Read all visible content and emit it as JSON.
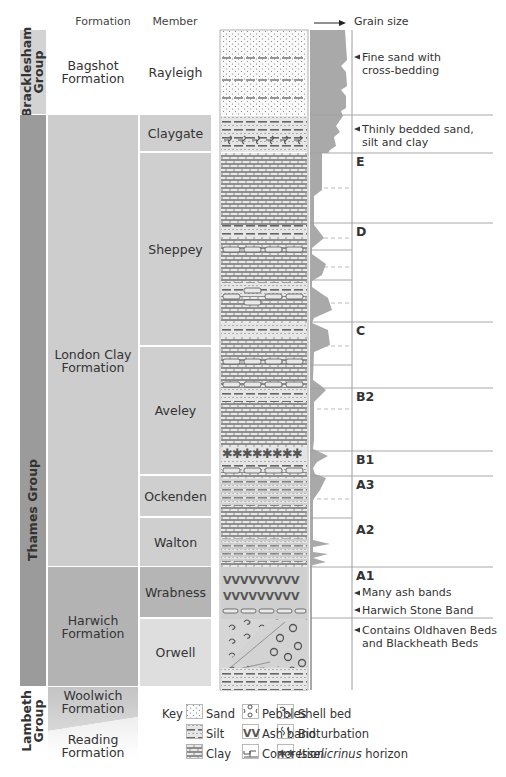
{
  "headers": {
    "formation": "Formation",
    "member": "Member",
    "grain_size": "Grain size"
  },
  "groups": [
    {
      "name": "Bracklesham Group",
      "line1": "Bracklesham",
      "line2": "Group",
      "color": "#d3d3d3"
    },
    {
      "name": "Thames Group",
      "line1": "Thames Group",
      "line2": "",
      "color": "#9b9b9b"
    },
    {
      "name": "Lambeth Group",
      "line1": "Lambeth",
      "line2": "Group",
      "color": "#ffffff"
    }
  ],
  "formations": [
    {
      "name": "Bagshot Formation",
      "line1": "Bagshot",
      "line2": "Formation"
    },
    {
      "name": "London Clay Formation",
      "line1": "London Clay",
      "line2": "Formation"
    },
    {
      "name": "Harwich Formation",
      "line1": "Harwich",
      "line2": "Formation"
    },
    {
      "name": "Woolwich Formation",
      "line1": "Woolwich",
      "line2": "Formation"
    },
    {
      "name": "Reading Formation",
      "line1": "Reading",
      "line2": "Formation"
    }
  ],
  "members": [
    {
      "name": "Rayleigh"
    },
    {
      "name": "Claygate"
    },
    {
      "name": "Sheppey"
    },
    {
      "name": "Aveley"
    },
    {
      "name": "Ockenden"
    },
    {
      "name": "Walton"
    },
    {
      "name": "Wrabness"
    },
    {
      "name": "Orwell"
    }
  ],
  "units": [
    "E",
    "D",
    "C",
    "B2",
    "B1",
    "A3",
    "A2",
    "A1"
  ],
  "notes": [
    {
      "line1": "Fine sand with",
      "line2": "cross-bedding"
    },
    {
      "line1": "Thinly bedded sand,",
      "line2": "silt and clay"
    },
    {
      "line1": "Many ash bands",
      "line2": ""
    },
    {
      "line1": "Harwich Stone Band",
      "line2": ""
    },
    {
      "line1": "Contains Oldhaven Beds",
      "line2": "and Blackheath Beds"
    }
  ],
  "key": {
    "title": "Key",
    "items": [
      {
        "label": "Sand",
        "icon": "sand-pattern"
      },
      {
        "label": "Silt",
        "icon": "silt-pattern"
      },
      {
        "label": "Clay",
        "icon": "clay-pattern"
      },
      {
        "label": "Pebbles",
        "icon": "pebbles-pattern"
      },
      {
        "label": "Ash band",
        "icon": "ash-band-pattern"
      },
      {
        "label": "Concretion",
        "icon": "concretion-pattern"
      },
      {
        "label": "Shell bed",
        "icon": "shell-bed-pattern"
      },
      {
        "label": "Bioturbation",
        "icon": "bioturbation-pattern"
      },
      {
        "label_italic": "Isselicrinus",
        "label": " horizon",
        "icon": "asterisk-pattern"
      }
    ]
  },
  "colors": {
    "thames_group": "#9b9b9b",
    "london_clay": "#cdcdcd",
    "harwich": "#b3b3b3",
    "member_light": "#cfcfcf",
    "wrabness": "#b5b5b5",
    "orwell": "#dedede",
    "grain_profile": "#a9a9a9"
  }
}
